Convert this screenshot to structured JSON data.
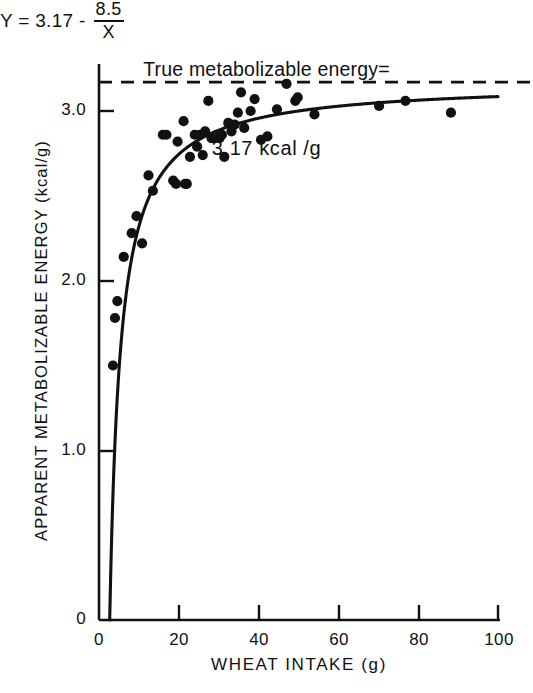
{
  "figure": {
    "title_line1": "True metabolizable energy=",
    "title_line2": "3.17 kcal /g",
    "equation": {
      "lhs": "Y = 3.17 -",
      "numerator": "8.5",
      "denominator": "X"
    }
  },
  "chart_data": {
    "type": "scatter",
    "title": "True metabolizable energy= 3.17 kcal /g",
    "xlabel": "WHEAT INTAKE (g)",
    "ylabel": "APPARENT METABOLIZABLE ENERGY (kcal/g)",
    "xlim": [
      0,
      100
    ],
    "ylim": [
      0,
      3.3
    ],
    "xticks": [
      0,
      20,
      40,
      60,
      80,
      100
    ],
    "xtick_labels": [
      "0",
      "20",
      "40",
      "60",
      "80",
      "100"
    ],
    "yticks": [
      0,
      1.0,
      2.0,
      3.0
    ],
    "ytick_labels": [
      "0",
      "1.0",
      "2.0",
      "3.0"
    ],
    "grid": false,
    "legend": null,
    "annotations": [
      {
        "name": "asymptote-label",
        "text": "True metabolizable energy= 3.17 kcal /g",
        "x": 50,
        "y": 3.3
      },
      {
        "name": "model-equation",
        "text": "Y = 3.17 - 8.5/X",
        "x": 48,
        "y": 1.58
      }
    ],
    "reference_line": {
      "name": "true-metabolizable-energy-asymptote",
      "orientation": "horizontal",
      "value": 3.17,
      "style": "dashed",
      "color": "#111111"
    },
    "fit_curve": {
      "name": "fitted-model-curve",
      "formula": "Y = 3.17 - 8.5 / X",
      "intercept": 3.17,
      "coefficient": 8.5,
      "x_start": 2.68,
      "x_end": 100,
      "style": "solid",
      "color": "#111111"
    },
    "series": [
      {
        "name": "observations",
        "marker": "filled-circle",
        "color": "#111111",
        "points": [
          [
            3.5,
            1.5
          ],
          [
            4.0,
            1.78
          ],
          [
            4.6,
            1.88
          ],
          [
            6.2,
            2.14
          ],
          [
            8.2,
            2.28
          ],
          [
            9.4,
            2.38
          ],
          [
            10.8,
            2.22
          ],
          [
            12.4,
            2.62
          ],
          [
            13.5,
            2.53
          ],
          [
            16.0,
            2.86
          ],
          [
            16.9,
            2.86
          ],
          [
            18.6,
            2.59
          ],
          [
            19.3,
            2.57
          ],
          [
            19.7,
            2.82
          ],
          [
            21.2,
            2.94
          ],
          [
            21.6,
            2.57
          ],
          [
            22.0,
            2.57
          ],
          [
            22.8,
            2.73
          ],
          [
            24.0,
            2.86
          ],
          [
            24.6,
            2.79
          ],
          [
            25.3,
            2.86
          ],
          [
            26.0,
            2.74
          ],
          [
            26.6,
            2.88
          ],
          [
            27.4,
            3.06
          ],
          [
            28.2,
            2.84
          ],
          [
            28.8,
            2.84
          ],
          [
            29.5,
            2.86
          ],
          [
            30.2,
            2.84
          ],
          [
            30.8,
            2.86
          ],
          [
            31.4,
            2.73
          ],
          [
            32.4,
            2.93
          ],
          [
            33.2,
            2.88
          ],
          [
            34.0,
            2.92
          ],
          [
            34.8,
            2.99
          ],
          [
            35.6,
            3.11
          ],
          [
            36.4,
            2.9
          ],
          [
            38.0,
            3.0
          ],
          [
            39.0,
            3.07
          ],
          [
            40.6,
            2.83
          ],
          [
            42.2,
            2.85
          ],
          [
            44.6,
            3.01
          ],
          [
            47.0,
            3.16
          ],
          [
            49.2,
            3.06
          ],
          [
            49.8,
            3.08
          ],
          [
            54.0,
            2.98
          ],
          [
            70.2,
            3.03
          ],
          [
            76.8,
            3.06
          ],
          [
            88.2,
            2.99
          ]
        ]
      }
    ]
  },
  "axes": {
    "y_tick_labels": [
      "3.0",
      "2.0",
      "1.0",
      "0"
    ],
    "x_tick_labels": [
      "0",
      "20",
      "40",
      "60",
      "80",
      "100"
    ],
    "x_title": "WHEAT INTAKE (g)",
    "y_title": "APPARENT METABOLIZABLE ENERGY (kcal/g)"
  }
}
